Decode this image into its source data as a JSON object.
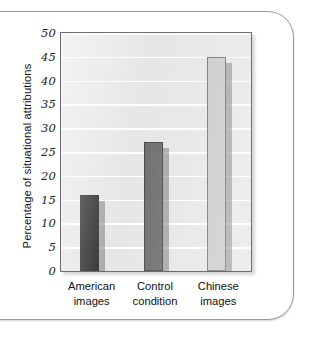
{
  "chart_data": {
    "type": "bar",
    "title": "",
    "xlabel": "",
    "ylabel": "Percentage of situational attributions",
    "categories": [
      "American images",
      "Control condition",
      "Chinese images"
    ],
    "category_lines": [
      [
        "American",
        "images"
      ],
      [
        "Control",
        "condition"
      ],
      [
        "Chinese",
        "images"
      ]
    ],
    "values": [
      16,
      27,
      45
    ],
    "ylim": [
      0,
      50
    ],
    "ytick_values": [
      0,
      5,
      10,
      15,
      20,
      25,
      30,
      35,
      40,
      45,
      50
    ],
    "ytick_labels": [
      "0",
      "5",
      "10",
      "15",
      "20",
      "25",
      "30",
      "35",
      "40",
      "45",
      "50"
    ],
    "grid": "horizontal",
    "legend": "none",
    "bar_colors": [
      "#2b2b2b",
      "#6e6e6e",
      "#c9c9c9"
    ],
    "plot_background": "#e6e6e6",
    "gridline_color": "#fdfdfd",
    "axis_color": "#6d6d6d"
  }
}
